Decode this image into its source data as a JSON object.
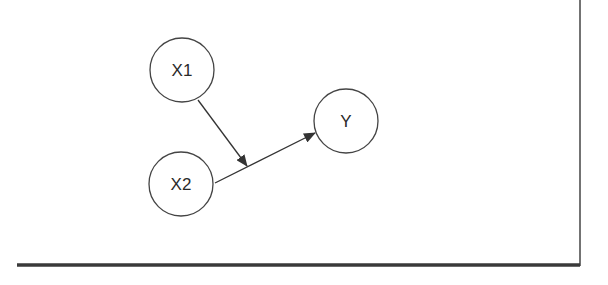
{
  "diagram": {
    "type": "path-diagram",
    "colors": {
      "stroke": "#333333",
      "node_fill": "#ffffff",
      "frame": "#333333"
    },
    "nodes": [
      {
        "id": "x1",
        "label": "X1",
        "cx": 182,
        "cy": 70,
        "r": 32
      },
      {
        "id": "x2",
        "label": "X2",
        "cx": 181,
        "cy": 184,
        "r": 32
      },
      {
        "id": "y",
        "label": "Y",
        "cx": 346,
        "cy": 121,
        "r": 32
      }
    ],
    "edges": [
      {
        "id": "x2-to-y",
        "from": "X2",
        "to": "Y",
        "x1": 215,
        "y1": 183,
        "x2": 315,
        "y2": 133
      },
      {
        "id": "x1-to-edge",
        "from": "X1",
        "to": "X2→Y path",
        "x1": 198,
        "y1": 100,
        "x2": 247,
        "y2": 166
      }
    ],
    "frame": {
      "bottom_rule": {
        "x1": 17,
        "x2": 580,
        "y": 265
      },
      "right_rule": {
        "x": 580,
        "y1": 0,
        "y2": 266
      }
    }
  }
}
